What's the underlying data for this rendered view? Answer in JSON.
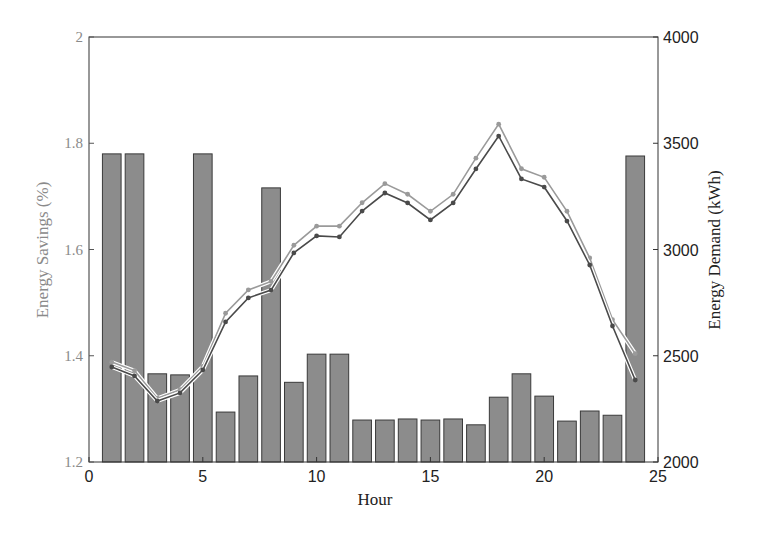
{
  "chart_data": {
    "type": "bar",
    "title": "",
    "xlabel": "Hour",
    "ylabel": "Energy Savings (%)",
    "y2label": "Energy Demand (kWh)",
    "xlim": [
      0,
      25
    ],
    "ylim": [
      1.2,
      2.0
    ],
    "y2lim": [
      2000,
      4000
    ],
    "x_ticks": [
      "0",
      "5",
      "10",
      "15",
      "20",
      "25"
    ],
    "y_ticks": [
      "1.2",
      "1.4",
      "1.6",
      "1.8",
      "2"
    ],
    "y2_ticks": [
      "2000",
      "2500",
      "3000",
      "3500",
      "4000"
    ],
    "grid": false,
    "legend": null,
    "categories": [
      1,
      2,
      3,
      4,
      5,
      6,
      7,
      8,
      9,
      10,
      11,
      12,
      13,
      14,
      15,
      16,
      17,
      18,
      19,
      20,
      21,
      22,
      23,
      24
    ],
    "series": [
      {
        "name": "Energy Savings (%)",
        "type": "bar",
        "axis": "left",
        "color": "#8c8c8c",
        "values": [
          1.78,
          1.78,
          1.366,
          1.364,
          1.78,
          1.294,
          1.362,
          1.716,
          1.35,
          1.403,
          1.403,
          1.279,
          1.279,
          1.281,
          1.279,
          1.281,
          1.27,
          1.322,
          1.366,
          1.324,
          1.277,
          1.296,
          1.288,
          1.776
        ]
      },
      {
        "name": "Energy Demand A (kWh)",
        "type": "line",
        "axis": "right",
        "color": "#9a9a9a",
        "values": [
          2470,
          2430,
          2300,
          2340,
          2450,
          2700,
          2810,
          2850,
          3020,
          3110,
          3110,
          3220,
          3310,
          3260,
          3180,
          3260,
          3430,
          3590,
          3380,
          3340,
          3180,
          2960,
          2670,
          2510
        ]
      },
      {
        "name": "Energy Demand B (kWh)",
        "type": "line",
        "axis": "right",
        "color": "#4a4a4a",
        "values": [
          2447,
          2405,
          2287,
          2325,
          2433,
          2659,
          2772,
          2809,
          2984,
          3064,
          3059,
          3181,
          3266,
          3219,
          3139,
          3219,
          3379,
          3534,
          3332,
          3294,
          3134,
          2927,
          2640,
          2386
        ]
      }
    ]
  },
  "axes": {
    "x_label": "Hour",
    "y_left_label": "Energy Savings (%)",
    "y_right_label": "Energy Demand (kWh)"
  }
}
